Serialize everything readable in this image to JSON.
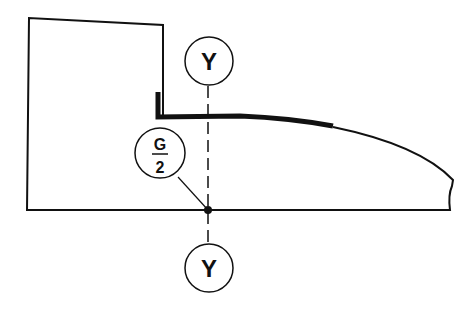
{
  "diagram": {
    "labels": {
      "top_axis": "Y",
      "bottom_axis": "Y",
      "center_numerator": "G",
      "center_denominator": "2"
    },
    "colors": {
      "stroke": "#111111",
      "background": "#ffffff"
    }
  }
}
